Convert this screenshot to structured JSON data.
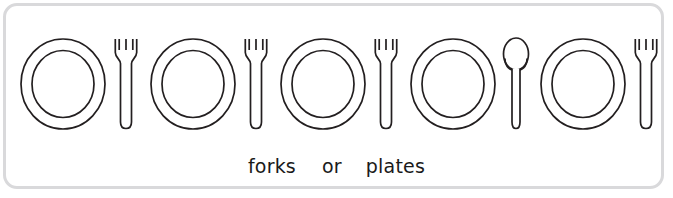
{
  "panel": {
    "border_color": "#d9d9db",
    "background_color": "#ffffff",
    "stroke_color": "#231f20"
  },
  "place_settings": [
    {
      "index": 1,
      "plate": "plate",
      "utensil": "fork"
    },
    {
      "index": 2,
      "plate": "plate",
      "utensil": "fork"
    },
    {
      "index": 3,
      "plate": "plate",
      "utensil": "fork"
    },
    {
      "index": 4,
      "plate": "plate",
      "utensil": "spoon"
    },
    {
      "index": 5,
      "plate": "plate",
      "utensil": "fork"
    }
  ],
  "caption": {
    "word_1": "forks",
    "connector": "or",
    "word_2": "plates",
    "full_text": "forks  or  plates",
    "color": "#1a1a1a"
  },
  "counts": {
    "plates": 5,
    "forks": 4,
    "spoons": 1
  }
}
